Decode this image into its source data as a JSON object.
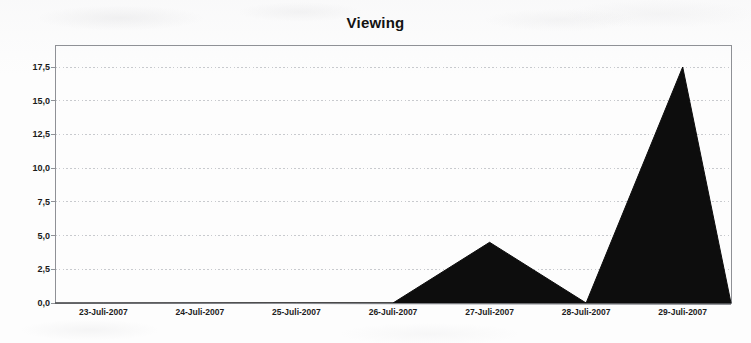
{
  "chart_data": {
    "type": "area",
    "title": "Viewing",
    "xlabel": "",
    "ylabel": "",
    "categories": [
      "23-Juli-2007",
      "24-Juli-2007",
      "25-Juli-2007",
      "26-Juli-2007",
      "27-Juli-2007",
      "28-Juli-2007",
      "29-Juli-2007"
    ],
    "values": [
      0,
      0,
      0,
      0,
      4.5,
      0,
      17.5
    ],
    "ylim": [
      0,
      17.5
    ],
    "yticks": [
      0,
      2.5,
      5,
      7.5,
      10,
      12.5,
      15,
      17.5
    ],
    "ytick_labels": [
      "0,0",
      "2,5",
      "5,0",
      "7,5",
      "10,0",
      "12,5",
      "15,0",
      "17,5"
    ],
    "grid": true,
    "legend": "none",
    "series_color": "#0d0d0d",
    "decimal_separator": ",",
    "axis_color": "#8f9196",
    "gridline_color": "#c8cace"
  },
  "plot": {
    "left": 55,
    "right": 731,
    "top": 45,
    "bottom": 303
  }
}
